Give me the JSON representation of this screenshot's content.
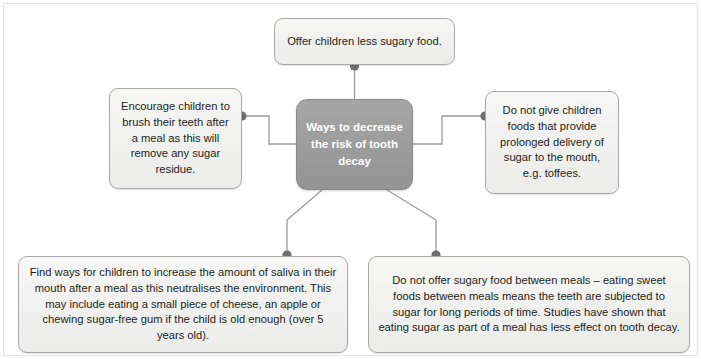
{
  "diagram": {
    "type": "mind-map",
    "frame_border_color": "#e3e3e3",
    "background_color": "#ffffff",
    "node_fill_color": "#f1f1ef",
    "node_border_color": "#a8a8a8",
    "center_fill_color": "#9d9d9d",
    "center_text_color": "#ffffff",
    "connector_color": "#9b9b9b",
    "connector_dot_color": "#6e6e6e",
    "center": {
      "id": "center",
      "label": "Ways to decrease the risk of tooth decay"
    },
    "branches": [
      {
        "id": "top",
        "position": "top",
        "label": "Offer children less sugary food."
      },
      {
        "id": "left",
        "position": "left",
        "label": "Encourage children to brush their teeth after a meal as this will remove any sugar residue."
      },
      {
        "id": "right",
        "position": "right",
        "label": "Do not give children foods that provide prolonged delivery of sugar to the mouth, e.g. toffees."
      },
      {
        "id": "bottom-left",
        "position": "bottom-left",
        "label": "Find ways for children to increase the amount of saliva in their mouth after a meal as this neutralises the environment. This may include eating a small piece of cheese, an apple or chewing sugar-free gum if the child is old enough (over 5 years old)."
      },
      {
        "id": "bottom-right",
        "position": "bottom-right",
        "label": "Do not offer sugary food between meals – eating sweet foods between meals means the teeth are subjected to sugar for long periods of time. Studies have shown that eating sugar as part of a meal has less effect on tooth decay."
      }
    ]
  }
}
